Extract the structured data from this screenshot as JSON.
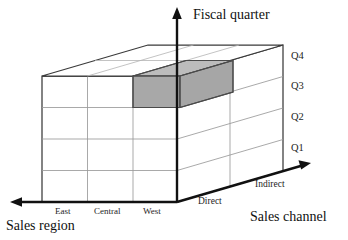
{
  "diagram": {
    "type": "3d-data-cube",
    "colors": {
      "background": "#ffffff",
      "cell_highlight": "#a8a8a8",
      "cell_highlight_top": "#bfbfbf",
      "cell_highlight_side": "#9a9a9a",
      "axis": "#111111",
      "grid": "#9a9a9a",
      "edge": "#3a3a3a"
    },
    "axes": {
      "vertical": {
        "title": "Fiscal quarter",
        "ticks": [
          "Q1",
          "Q2",
          "Q3",
          "Q4"
        ]
      },
      "horizontal_left": {
        "title": "Sales region",
        "ticks": [
          "East",
          "Central",
          "West"
        ]
      },
      "depth_right": {
        "title": "Sales channel",
        "ticks": [
          "Direct",
          "Indirect"
        ]
      }
    },
    "highlighted_cell": {
      "region": "West",
      "quarter": "Q4",
      "channel": "Direct",
      "fill": "#a8a8a8"
    }
  }
}
